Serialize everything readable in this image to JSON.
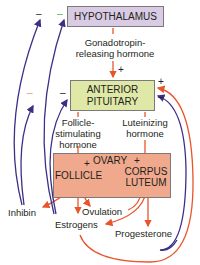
{
  "nodes": {
    "hypothalamus": "HYPOTHALAMUS",
    "anterior_pituitary_line1": "ANTERIOR",
    "anterior_pituitary_line2": "PITUITARY",
    "ovary": "OVARY",
    "follicle": "FOLLICLE",
    "corpus_luteum_line1": "CORPUS",
    "corpus_luteum_line2": "LUTEUM"
  },
  "labels": {
    "gnrh_line1": "Gonadotropin-",
    "gnrh_line2": "releasing hormone",
    "fsh_line1": "Follicle-",
    "fsh_line2": "stimulating",
    "fsh_line3": "hormone",
    "lh_line1": "Luteinizing",
    "lh_line2": "hormone",
    "inhibin": "Inhibin",
    "ovulation": "Ovulation",
    "estrogens": "Estrogens",
    "progesterone": "Progesterone"
  },
  "signs": {
    "plus": "+",
    "minus": "–"
  },
  "colors": {
    "hypothalamus_box": "#d8cbe3",
    "pituitary_box": "#dfe8a6",
    "ovary_box": "#f0a98d",
    "stimulatory_arrow": "#e8552a",
    "inhibitory_arrow": "#3b2f86",
    "minus_green": "#5bb04a",
    "minus_orange": "#e0a070"
  }
}
